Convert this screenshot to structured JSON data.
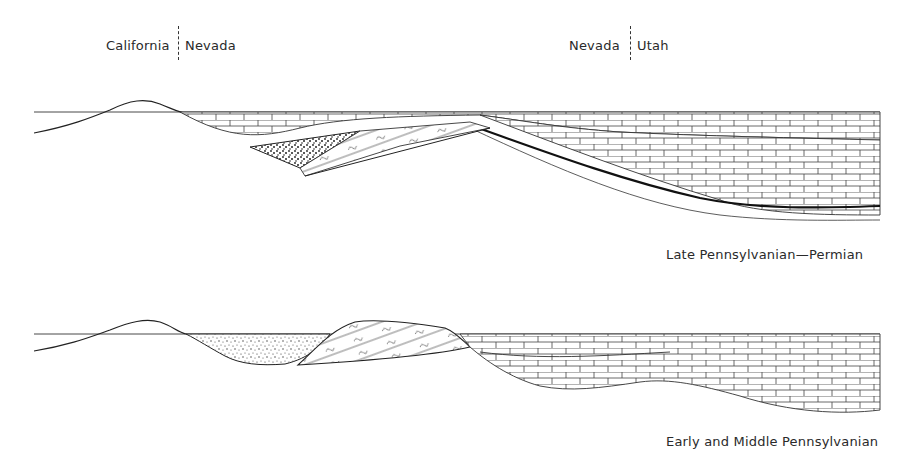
{
  "figure": {
    "type": "geologic-cross-section",
    "state_labels": {
      "left_west": "California",
      "left_east": "Nevada",
      "right_west": "Nevada",
      "right_east": "Utah"
    },
    "panels": [
      {
        "id": "upper",
        "caption": "Late Pennsylvanian—Permian",
        "features": [
          "highland",
          "limestone shelf",
          "coarse clastic wedge",
          "thrust-deformed sediments",
          "basin limestone with dark marker bed"
        ]
      },
      {
        "id": "lower",
        "caption": "Early and Middle Pennsylvanian",
        "features": [
          "highland",
          "conglomerate/sandstone-filled trough",
          "uplifted deformed block",
          "limestone shelf"
        ]
      }
    ],
    "colors": {
      "ink": "#2a2a2a",
      "paper": "#ffffff"
    }
  }
}
